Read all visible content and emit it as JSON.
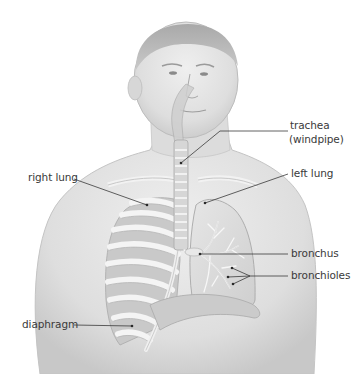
{
  "figure": {
    "labels": {
      "trachea": "trachea",
      "trachea_alt": "(windpipe)",
      "left_lung": "left lung",
      "right_lung": "right lung",
      "bronchus": "bronchus",
      "bronchioles": "bronchioles",
      "diaphragm": "diaphragm"
    },
    "colors": {
      "background": "#ffffff",
      "skin": "#e4e4e4",
      "shadow": "#bdbdbd",
      "leader_line": "#3a3a3a",
      "text": "#3a3a3a"
    }
  }
}
